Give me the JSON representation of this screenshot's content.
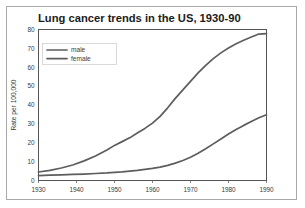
{
  "chart_data": {
    "type": "line",
    "title": "Lung cancer trends in the US, 1930-90",
    "xlabel": "",
    "ylabel": "Rate per 100,000",
    "xlim": [
      1930,
      1990
    ],
    "ylim": [
      0,
      80
    ],
    "grid": true,
    "legend_position": "top-left",
    "yticks": [
      "0",
      "10",
      "20",
      "30",
      "40",
      "50",
      "60",
      "70",
      "80"
    ],
    "xticks": [
      "1930",
      "1940",
      "1950",
      "1960",
      "1970",
      "1980",
      "1990"
    ],
    "x": [
      1930,
      1933,
      1936,
      1939,
      1942,
      1945,
      1948,
      1950,
      1952,
      1954,
      1956,
      1958,
      1960,
      1962,
      1964,
      1966,
      1968,
      1970,
      1972,
      1974,
      1976,
      1978,
      1980,
      1982,
      1984,
      1986,
      1988,
      1990
    ],
    "series": [
      {
        "name": "male",
        "color": "#5d5d5d",
        "values": [
          4.5,
          5.4,
          6.6,
          8.2,
          10.4,
          13.0,
          16.2,
          18.6,
          20.6,
          22.6,
          25.2,
          27.6,
          30.4,
          34.0,
          38.5,
          43.5,
          48.0,
          52.5,
          57.0,
          61.0,
          64.6,
          67.6,
          70.2,
          72.4,
          74.3,
          76.0,
          77.6,
          77.8
        ]
      },
      {
        "name": "female",
        "color": "#5d5d5d",
        "values": [
          2.6,
          2.8,
          3.0,
          3.2,
          3.4,
          3.7,
          4.0,
          4.3,
          4.6,
          5.0,
          5.4,
          5.9,
          6.4,
          7.1,
          8.0,
          9.2,
          10.6,
          12.3,
          14.4,
          16.8,
          19.4,
          22.0,
          24.6,
          27.0,
          29.2,
          31.2,
          33.2,
          34.8
        ]
      }
    ]
  }
}
